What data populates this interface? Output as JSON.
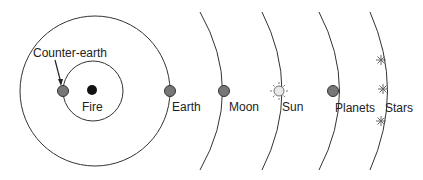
{
  "labels": {
    "counter_earth": "Counter-earth",
    "fire": "Fire",
    "earth": "Earth",
    "moon": "Moon",
    "sun": "Sun",
    "planets": "Planets",
    "stars": "Stars"
  },
  "colors": {
    "line": "#333333",
    "body_fill": "#777777",
    "fire_fill": "#111111",
    "sun_fill": "#e8e8e8",
    "star": "#666666"
  }
}
